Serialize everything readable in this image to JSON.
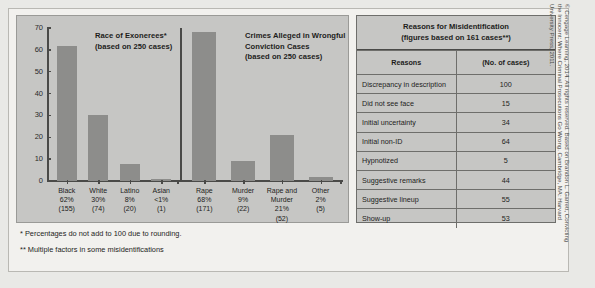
{
  "chart_data": [
    {
      "type": "bar",
      "title": "Race of Exonerees*",
      "subtitle": "(based on 250 cases)",
      "xlabel": "",
      "ylabel": "",
      "ylim": [
        0,
        70
      ],
      "yticks": [
        0,
        10,
        20,
        30,
        40,
        50,
        60,
        70
      ],
      "grid": false,
      "categories": [
        "Black",
        "White",
        "Latino",
        "Asian"
      ],
      "values": [
        62,
        30,
        8,
        1
      ],
      "tick_labels": [
        {
          "name": "Black",
          "pct": "62%",
          "count": "(155)"
        },
        {
          "name": "White",
          "pct": "30%",
          "count": "(74)"
        },
        {
          "name": "Latino",
          "pct": "8%",
          "count": "(20)"
        },
        {
          "name": "Asian",
          "pct": "<1%",
          "count": "(1)"
        }
      ]
    },
    {
      "type": "bar",
      "title": "Crimes Alleged in Wrongful Conviction Cases",
      "title_lines": [
        "Crimes Alleged in Wrongful",
        "Conviction Cases"
      ],
      "subtitle": "(based on 250 cases)",
      "xlabel": "",
      "ylabel": "",
      "ylim": [
        0,
        70
      ],
      "grid": false,
      "categories": [
        "Rape",
        "Murder",
        "Rape and Murder",
        "Other"
      ],
      "values": [
        68,
        9,
        21,
        2
      ],
      "tick_labels": [
        {
          "name": "Rape",
          "pct": "68%",
          "count": "(171)"
        },
        {
          "name": "Murder",
          "pct": "9%",
          "count": "(22)"
        },
        {
          "name": "Rape and Murder",
          "name_lines": [
            "Rape and",
            "Murder"
          ],
          "pct": "21%",
          "count": "(52)"
        },
        {
          "name": "Other",
          "pct": "2%",
          "count": "(5)"
        }
      ]
    },
    {
      "type": "table",
      "title": "Reasons for Misidentification",
      "subtitle": "(figures based on 161 cases**)",
      "columns": [
        "Reasons",
        "(No. of cases)"
      ],
      "categories": [
        "Discrepancy in description",
        "Did not see face",
        "Initial uncertainty",
        "Initial non-ID",
        "Hypnotized",
        "Suggestive remarks",
        "Suggestive lineup",
        "Show-up"
      ],
      "values": [
        100,
        15,
        34,
        64,
        5,
        44,
        55,
        53
      ]
    }
  ],
  "chart_a": {
    "title_line1": "Race of Exonerees*",
    "title_line2": "(based on 250 cases)",
    "yticks": [
      "70",
      "60",
      "50",
      "40",
      "30",
      "20",
      "10",
      "0"
    ]
  },
  "chart_b": {
    "title_line1": "Crimes Alleged in Wrongful",
    "title_line2": "Conviction Cases",
    "title_line3": "(based on 250 cases)"
  },
  "table": {
    "title_line1": "Reasons for Misidentification",
    "title_line2": "(figures based on 161 cases**)",
    "header_reasons": "Reasons",
    "header_count": "(No. of cases)",
    "rows": [
      {
        "reason": "Discrepancy in description",
        "count": "100"
      },
      {
        "reason": "Did not see face",
        "count": "15"
      },
      {
        "reason": "Initial uncertainty",
        "count": "34"
      },
      {
        "reason": "Initial non-ID",
        "count": "64"
      },
      {
        "reason": "Hypnotized",
        "count": "5"
      },
      {
        "reason": "Suggestive remarks",
        "count": "44"
      },
      {
        "reason": "Suggestive lineup",
        "count": "55"
      },
      {
        "reason": "Show-up",
        "count": "53"
      }
    ]
  },
  "notes": {
    "note1": "* Percentages do not add to 100 due to rounding.",
    "note2": "** Multiple factors in some misidentifications"
  },
  "credit": "© Cengage Learning, 2014. All rights reserved. Based on Brandon L. Garrett, Convicting the Innocent: Where Criminal Prosecutions Go Wrong. Cambridge, MA: Harvard University Press, 2011.",
  "colors": {
    "bar": "#8d8d8b",
    "panel": "#c6c6c4",
    "page": "#f2f1ee",
    "axis": "#4a4a48",
    "text": "#1d1d1b"
  }
}
